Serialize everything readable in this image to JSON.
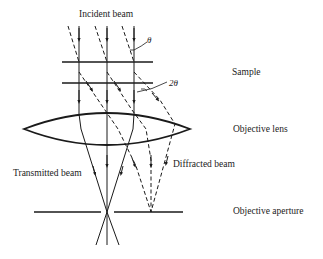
{
  "labels": {
    "incident_beam": "Incident beam",
    "theta": "θ",
    "two_theta": "2θ",
    "sample": "Sample",
    "objective_lens": "Objective lens",
    "diffracted_beam": "Diffracted beam",
    "transmitted_beam": "Transmitted beam",
    "objective_aperture": "Objective aperture"
  },
  "colors": {
    "line": "#1a1a1a",
    "background": "#ffffff"
  }
}
